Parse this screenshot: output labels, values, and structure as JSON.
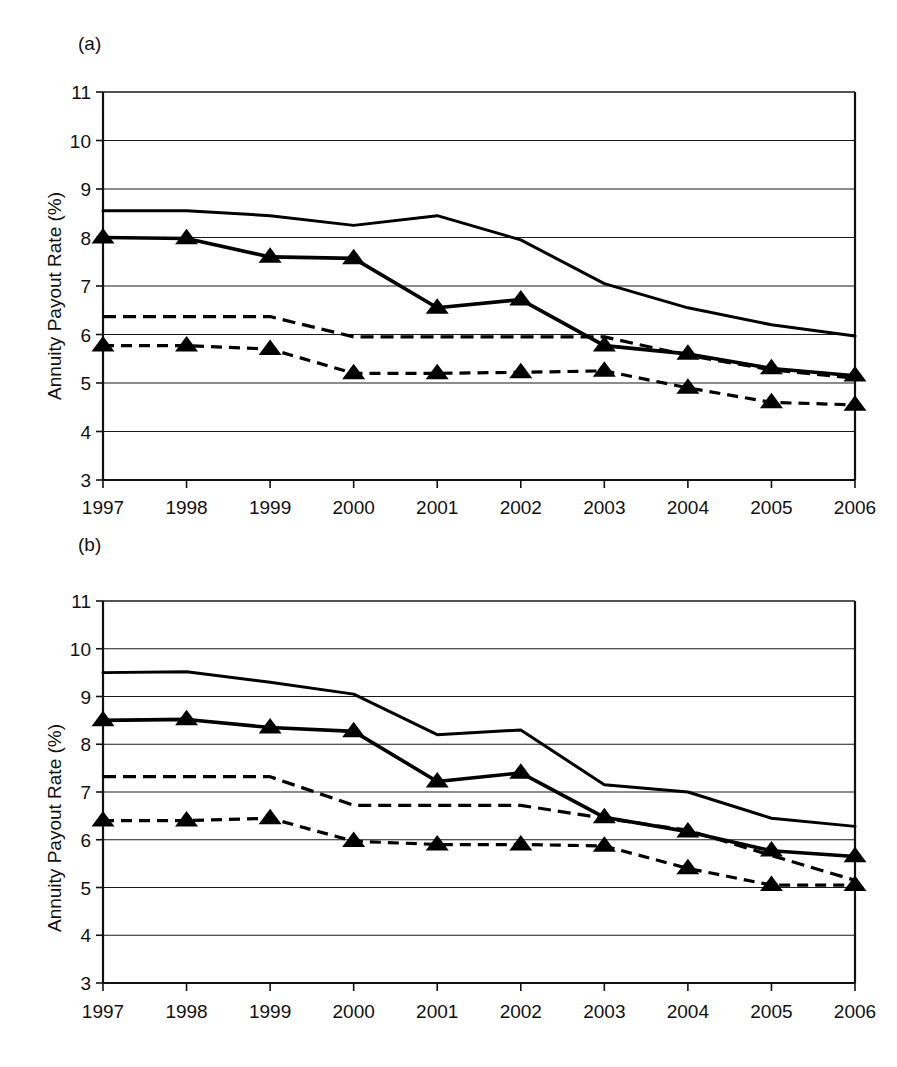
{
  "figure": {
    "background": "#ffffff",
    "ink_color": "#000000",
    "panels": [
      "a",
      "b"
    ]
  },
  "panel_a": {
    "tag": "(a)",
    "ylabel": "Annuity Payout Rate (%)"
  },
  "panel_b": {
    "tag": "(b)",
    "ylabel": "Annuity Payout Rate (%)"
  },
  "chart_data": [
    {
      "panel": "a",
      "type": "line",
      "title": "(a)",
      "xlabel": "",
      "ylabel": "Annuity Payout Rate (%)",
      "x": [
        1997,
        1998,
        1999,
        2000,
        2001,
        2002,
        2003,
        2004,
        2005,
        2006
      ],
      "categories": [
        "1997",
        "1998",
        "1999",
        "2000",
        "2001",
        "2002",
        "2003",
        "2004",
        "2005",
        "2006"
      ],
      "xtick_labels": [
        "1997",
        "1998",
        "1999",
        "2000",
        "2001",
        "2002",
        "2003",
        "2004",
        "2005",
        "2006"
      ],
      "ytick_labels": [
        "3",
        "4",
        "5",
        "6",
        "7",
        "8",
        "9",
        "10",
        "11"
      ],
      "ylim": [
        3,
        11
      ],
      "xlim": [
        1997,
        2006
      ],
      "grid": true,
      "legend": "none",
      "series": [
        {
          "name": "solid-no-marker",
          "style": "solid",
          "marker": "none",
          "values": [
            8.55,
            8.55,
            8.45,
            8.25,
            8.45,
            7.95,
            7.05,
            6.55,
            6.2,
            5.97
          ]
        },
        {
          "name": "solid-triangle-marker",
          "style": "solid",
          "marker": "triangle",
          "values": [
            8.0,
            7.98,
            7.6,
            7.57,
            6.55,
            6.72,
            5.77,
            5.6,
            5.3,
            5.15
          ]
        },
        {
          "name": "dashed-no-marker",
          "style": "dashed",
          "marker": "none",
          "values": [
            6.37,
            6.37,
            6.37,
            5.95,
            5.95,
            5.95,
            5.95,
            5.57,
            5.27,
            5.1
          ]
        },
        {
          "name": "dashed-triangle-marker",
          "style": "dashed",
          "marker": "triangle",
          "values": [
            5.77,
            5.77,
            5.7,
            5.2,
            5.2,
            5.22,
            5.25,
            4.9,
            4.6,
            4.55
          ]
        }
      ]
    },
    {
      "panel": "b",
      "type": "line",
      "title": "(b)",
      "xlabel": "",
      "ylabel": "Annuity Payout Rate (%)",
      "x": [
        1997,
        1998,
        1999,
        2000,
        2001,
        2002,
        2003,
        2004,
        2005,
        2006
      ],
      "categories": [
        "1997",
        "1998",
        "1999",
        "2000",
        "2001",
        "2002",
        "2003",
        "2004",
        "2005",
        "2006"
      ],
      "xtick_labels": [
        "1997",
        "1998",
        "1999",
        "2000",
        "2001",
        "2002",
        "2003",
        "2004",
        "2005",
        "2006"
      ],
      "ytick_labels": [
        "3",
        "4",
        "5",
        "6",
        "7",
        "8",
        "9",
        "10",
        "11"
      ],
      "ylim": [
        3,
        11
      ],
      "xlim": [
        1997,
        2006
      ],
      "grid": true,
      "legend": "none",
      "series": [
        {
          "name": "solid-no-marker",
          "style": "solid",
          "marker": "none",
          "values": [
            9.5,
            9.52,
            9.3,
            9.05,
            8.2,
            8.3,
            7.15,
            7.0,
            6.45,
            6.28
          ]
        },
        {
          "name": "solid-triangle-marker",
          "style": "solid",
          "marker": "triangle",
          "values": [
            8.5,
            8.52,
            8.35,
            8.27,
            7.22,
            7.4,
            6.47,
            6.17,
            5.77,
            5.65
          ]
        },
        {
          "name": "dashed-no-marker",
          "style": "dashed",
          "marker": "none",
          "values": [
            7.32,
            7.32,
            7.32,
            6.72,
            6.72,
            6.72,
            6.45,
            6.2,
            5.67,
            5.15
          ]
        },
        {
          "name": "dashed-triangle-marker",
          "style": "dashed",
          "marker": "triangle",
          "values": [
            6.4,
            6.4,
            6.45,
            5.97,
            5.9,
            5.9,
            5.87,
            5.4,
            5.05,
            5.05
          ]
        }
      ]
    }
  ]
}
